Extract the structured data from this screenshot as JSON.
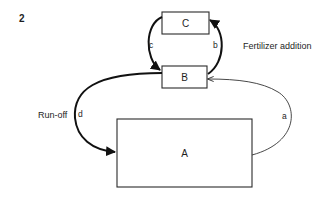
{
  "figure": {
    "number": "2"
  },
  "compartments": {
    "A": {
      "label": "A"
    },
    "B": {
      "label": "B"
    },
    "C": {
      "label": "C"
    }
  },
  "flows": {
    "a": {
      "label": "a",
      "from": "A",
      "to": "B"
    },
    "b": {
      "label": "b",
      "from": "B",
      "to": "C"
    },
    "c": {
      "label": "c",
      "from": "C",
      "to": "B"
    },
    "d": {
      "label": "d",
      "from": "B",
      "to": "A"
    }
  },
  "annotations": {
    "fertilizer": "Fertilizer addition",
    "runoff": "Run-off"
  },
  "colors": {
    "stroke": "#2a2a2a",
    "text": "#1e1e1e",
    "background": "#ffffff"
  }
}
